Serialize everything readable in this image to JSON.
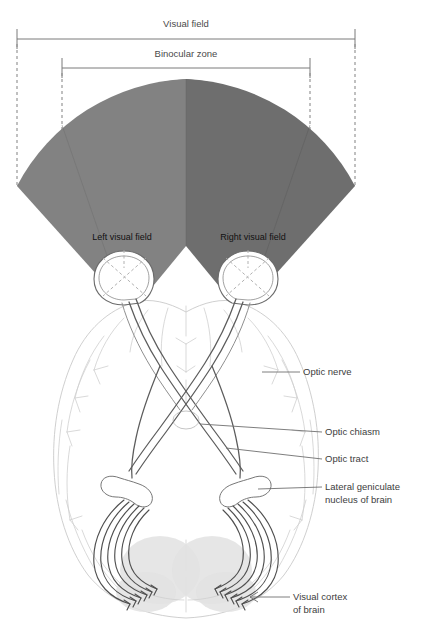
{
  "figure": {
    "background": "#ffffff"
  },
  "dimensions": {
    "visual_field_label": "Visual field",
    "binocular_zone_label": "Binocular zone"
  },
  "fields": {
    "left_label": "Left visual field",
    "right_label": "Right visual field",
    "left_color": "#828282",
    "right_color": "#6e6e6e"
  },
  "callouts": [
    {
      "id": "optic-nerve",
      "label": "Optic nerve"
    },
    {
      "id": "optic-chiasm",
      "label": "Optic chiasm"
    },
    {
      "id": "optic-tract",
      "label": "Optic tract"
    },
    {
      "id": "lateral-geniculate-nucleus",
      "label": "Lateral geniculate",
      "label2": "nucleus of brain"
    },
    {
      "id": "visual-cortex",
      "label": "Visual cortex",
      "label2": "of brain"
    }
  ],
  "colors": {
    "rule": "#7a7a7a",
    "dash": "#8d8d8d",
    "leader": "#6f6f6f",
    "brain_outline": "#c9c9c9",
    "nerve": "#5c5c5c",
    "cortex": "#e2e2e2",
    "text": "#3d3d3d"
  }
}
